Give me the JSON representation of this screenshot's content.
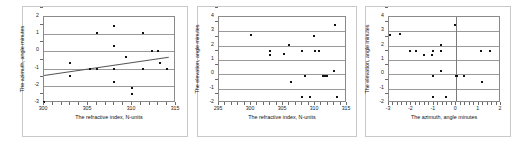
{
  "figure": {
    "panel_count": 3,
    "background": "#ffffff",
    "point_color": "#111111",
    "grid_color": "#9a9a9a",
    "axis_color": "#8a8a8a",
    "trend_color": "#555555"
  },
  "chart_data": [
    {
      "id": "chart-1",
      "type": "scatter",
      "title": "",
      "xlabel": "The refractive index, N-units",
      "ylabel": "The azimuth, angle minutes",
      "xlim": [
        300,
        315
      ],
      "ylim": [
        -3,
        2
      ],
      "xticks": [
        300,
        305,
        310,
        315
      ],
      "xtick_labels": [
        "300",
        "305",
        "310",
        "315"
      ],
      "yticks": [
        -3,
        -2,
        -1,
        0,
        1,
        2
      ],
      "ytick_labels": [
        "-3",
        "-2",
        "-1",
        "0",
        "1",
        "2"
      ],
      "grid": true,
      "legend": "none",
      "x": [
        300.0,
        303.0,
        303.0,
        305.2,
        306.0,
        306.0,
        308.0,
        308.0,
        308.0,
        308.0,
        308.0,
        309.3,
        310.0,
        310.0,
        311.2,
        311.2,
        312.3,
        312.9,
        313.2,
        314.0
      ],
      "y": [
        -2.95,
        -0.7,
        -1.45,
        -1.05,
        1.05,
        -1.05,
        1.45,
        0.3,
        -1.05,
        -1.8,
        -1.05,
        -0.35,
        -2.15,
        -2.5,
        1.05,
        -1.05,
        0.0,
        0.0,
        -0.7,
        -1.05
      ],
      "trendline": {
        "present": true,
        "x_start": 300,
        "y_start": -1.38,
        "x_end": 314.2,
        "y_end": -0.32
      }
    },
    {
      "id": "chart-2",
      "type": "scatter",
      "title": "",
      "xlabel": "The refractive index, N-units",
      "ylabel": "The elevation, angle minutes",
      "xlim": [
        295,
        315
      ],
      "ylim": [
        -2,
        4
      ],
      "xticks": [
        295,
        300,
        305,
        310,
        315
      ],
      "xtick_labels": [
        "295",
        "300",
        "305",
        "310",
        "315"
      ],
      "yticks": [
        -2,
        -1,
        0,
        1,
        2,
        3,
        4
      ],
      "ytick_labels": [
        "-2",
        "-1",
        "0",
        "1",
        "2",
        "3",
        "4"
      ],
      "grid": true,
      "legend": "none",
      "x": [
        300.0,
        303.0,
        303.0,
        305.2,
        306.0,
        306.2,
        308.0,
        308.0,
        308.4,
        309.2,
        309.8,
        310.0,
        310.6,
        311.2,
        311.5,
        311.8,
        313.0,
        313.2,
        313.4
      ],
      "y": [
        2.75,
        1.65,
        1.35,
        1.4,
        2.05,
        -0.5,
        1.65,
        -1.6,
        -0.1,
        -1.6,
        2.7,
        1.65,
        1.65,
        -0.15,
        -0.12,
        -0.15,
        0.2,
        3.45,
        -1.6
      ]
    },
    {
      "id": "chart-3",
      "type": "scatter",
      "title": "",
      "xlabel": "The azimuth, angle minutes",
      "ylabel": "The elevation, angle minutes",
      "xlim": [
        -3,
        2
      ],
      "ylim": [
        -2,
        4
      ],
      "xticks": [
        -3,
        -2,
        -1,
        0,
        1,
        2
      ],
      "xtick_labels": [
        "-3",
        "-2",
        "-1",
        "0",
        "1",
        "2"
      ],
      "yticks": [
        -2,
        -1,
        0,
        1,
        2,
        3,
        4
      ],
      "ytick_labels": [
        "-2",
        "-1",
        "0",
        "1",
        "2",
        "3",
        "4"
      ],
      "grid": true,
      "zero_vline": 0,
      "legend": "none",
      "x": [
        -2.95,
        -2.5,
        -2.05,
        -1.8,
        -1.45,
        -1.1,
        -1.05,
        -1.05,
        -1.05,
        -0.7,
        -0.7,
        -0.7,
        -0.45,
        -0.05,
        0.0,
        0.05,
        0.35,
        1.1,
        1.15,
        1.5
      ],
      "y": [
        2.75,
        2.78,
        1.65,
        1.65,
        1.35,
        1.35,
        1.65,
        -0.15,
        -1.6,
        2.05,
        1.65,
        0.25,
        -1.6,
        3.45,
        -0.12,
        -0.1,
        -0.1,
        1.65,
        -0.5,
        1.65
      ]
    }
  ]
}
